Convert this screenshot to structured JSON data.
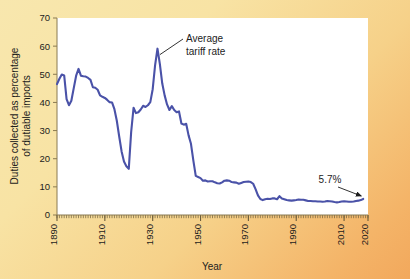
{
  "chart_data": {
    "type": "line",
    "title": "",
    "xlabel": "Year",
    "ylabel": "Duties collected as percentage of dutiable imports",
    "xlim": [
      1890,
      2020
    ],
    "ylim": [
      0,
      70
    ],
    "grid": false,
    "legend": "none",
    "line_color": "#4a52a8",
    "plot_background": "#ffffff",
    "figure_background_start": "#f8e7ae",
    "figure_background_end": "#f2a85c",
    "xticks": [
      "1890",
      "1910",
      "1930",
      "1950",
      "1970",
      "1990",
      "2010",
      "2020"
    ],
    "xtick_values": [
      1890,
      1910,
      1930,
      1950,
      1970,
      1990,
      2010,
      2020
    ],
    "xtick_minor_step": 1,
    "yticks": [
      "0",
      "10",
      "20",
      "30",
      "40",
      "50",
      "60",
      "70"
    ],
    "ytick_values": [
      0,
      10,
      20,
      30,
      40,
      50,
      60,
      70
    ],
    "annotations": [
      {
        "name": "average-tariff-rate",
        "text_line1": "Average",
        "text_line2": "tariff rate",
        "points_to_x": 1932,
        "points_to_y": 57.0
      },
      {
        "name": "final-value",
        "text": "5.7%",
        "points_to_x": 2018,
        "points_to_y": 5.7
      }
    ],
    "series": [
      {
        "name": "Average tariff rate",
        "x": [
          1890,
          1891,
          1892,
          1893,
          1894,
          1895,
          1896,
          1897,
          1898,
          1899,
          1900,
          1901,
          1902,
          1903,
          1904,
          1905,
          1906,
          1907,
          1908,
          1909,
          1910,
          1911,
          1912,
          1913,
          1914,
          1915,
          1916,
          1917,
          1918,
          1919,
          1920,
          1921,
          1922,
          1923,
          1924,
          1925,
          1926,
          1927,
          1928,
          1929,
          1930,
          1931,
          1932,
          1933,
          1934,
          1935,
          1936,
          1937,
          1938,
          1939,
          1940,
          1941,
          1942,
          1943,
          1944,
          1945,
          1946,
          1947,
          1948,
          1949,
          1950,
          1951,
          1952,
          1953,
          1954,
          1955,
          1956,
          1957,
          1958,
          1959,
          1960,
          1961,
          1962,
          1963,
          1964,
          1965,
          1966,
          1967,
          1968,
          1969,
          1970,
          1971,
          1972,
          1973,
          1974,
          1975,
          1976,
          1977,
          1978,
          1979,
          1980,
          1981,
          1982,
          1983,
          1984,
          1985,
          1986,
          1987,
          1988,
          1989,
          1990,
          1991,
          1992,
          1993,
          1994,
          1995,
          1996,
          1997,
          1998,
          1999,
          2000,
          2001,
          2002,
          2003,
          2004,
          2005,
          2006,
          2007,
          2008,
          2009,
          2010,
          2011,
          2012,
          2013,
          2014,
          2015,
          2016,
          2017,
          2018
        ],
        "values": [
          46.5,
          48.4,
          49.9,
          49.6,
          41.2,
          39.0,
          40.6,
          45.1,
          49.5,
          51.9,
          49.5,
          49.3,
          49.2,
          48.7,
          48.0,
          45.4,
          45.2,
          44.5,
          42.5,
          42.0,
          41.6,
          40.9,
          40.1,
          40.0,
          37.6,
          33.5,
          27.9,
          22.6,
          19.0,
          17.3,
          16.4,
          29.5,
          38.1,
          36.2,
          36.5,
          37.5,
          38.8,
          38.4,
          39.0,
          40.1,
          44.7,
          53.2,
          59.1,
          53.6,
          46.7,
          42.5,
          39.3,
          37.3,
          38.7,
          37.3,
          36.5,
          36.8,
          32.5,
          32.1,
          32.4,
          28.3,
          25.3,
          19.3,
          13.9,
          13.5,
          13.1,
          12.2,
          12.3,
          11.9,
          12.0,
          12.0,
          11.6,
          11.3,
          11.2,
          11.6,
          12.2,
          12.3,
          12.2,
          11.7,
          11.6,
          11.5,
          11.1,
          11.4,
          11.7,
          11.8,
          11.9,
          11.7,
          11.1,
          9.2,
          7.0,
          5.7,
          5.3,
          5.6,
          5.8,
          5.7,
          5.9,
          5.9,
          5.6,
          6.7,
          5.9,
          5.6,
          5.3,
          5.2,
          5.1,
          5.2,
          5.3,
          5.5,
          5.4,
          5.4,
          5.2,
          5.0,
          5.0,
          4.9,
          4.9,
          4.8,
          4.8,
          4.7,
          4.8,
          5.0,
          4.9,
          4.8,
          4.6,
          4.5,
          4.6,
          4.8,
          4.9,
          4.8,
          4.7,
          4.7,
          4.8,
          5.0,
          5.1,
          5.3,
          5.7
        ]
      }
    ]
  }
}
